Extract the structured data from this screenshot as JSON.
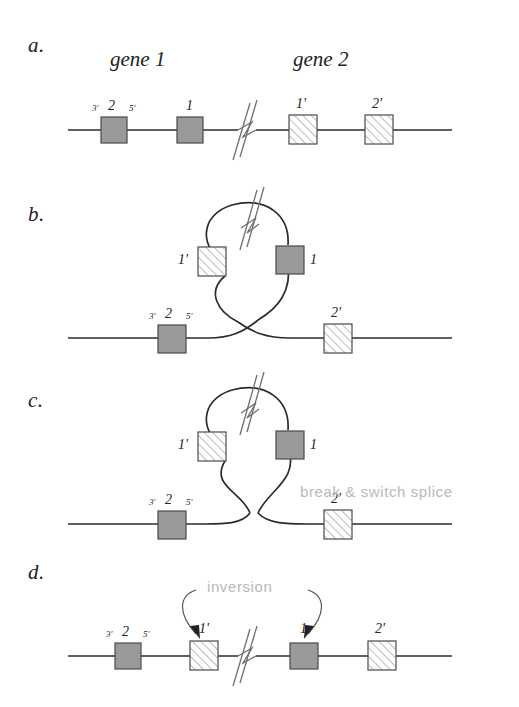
{
  "figure": {
    "panels": [
      {
        "letter": "a.",
        "titles": [
          "gene 1",
          "gene 2"
        ],
        "boxes": [
          {
            "label": "2",
            "prime_left": "3'",
            "prime_right": "5'",
            "style": "gray"
          },
          {
            "label": "1",
            "style": "gray"
          },
          {
            "label": "1'",
            "style": "hatched"
          },
          {
            "label": "2'",
            "style": "hatched"
          }
        ]
      },
      {
        "letter": "b.",
        "boxes": [
          {
            "label": "1'",
            "style": "hatched"
          },
          {
            "label": "1",
            "style": "gray"
          },
          {
            "label": "2",
            "prime_left": "3'",
            "prime_right": "5'",
            "style": "gray"
          },
          {
            "label": "2'",
            "style": "hatched"
          }
        ]
      },
      {
        "letter": "c.",
        "annotation": "break & switch splice",
        "boxes": [
          {
            "label": "1'",
            "style": "hatched"
          },
          {
            "label": "1",
            "style": "gray"
          },
          {
            "label": "2",
            "prime_left": "3'",
            "prime_right": "5'",
            "style": "gray"
          },
          {
            "label": "2'",
            "style": "hatched"
          }
        ]
      },
      {
        "letter": "d.",
        "annotation": "inversion",
        "boxes": [
          {
            "label": "2",
            "prime_left": "3'",
            "prime_right": "5'",
            "style": "gray"
          },
          {
            "label": "1'",
            "style": "hatched"
          },
          {
            "label": "1",
            "style": "gray"
          },
          {
            "label": "2'",
            "style": "hatched"
          }
        ]
      }
    ],
    "colors": {
      "gray_box_fill": "#9a9a9a",
      "box_stroke": "#4a4a4a",
      "strand": "#2b2b2b",
      "annotation_text": "#b9b9b9"
    }
  }
}
